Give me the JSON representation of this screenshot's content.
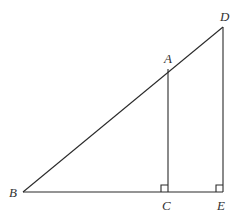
{
  "diagram": {
    "type": "similar right triangles",
    "points": {
      "B": {
        "label": "B",
        "x": 23,
        "y": 192
      },
      "C": {
        "label": "C",
        "x": 168,
        "y": 192
      },
      "E": {
        "label": "E",
        "x": 223,
        "y": 192
      },
      "A": {
        "label": "A",
        "x": 168,
        "y": 69
      },
      "D": {
        "label": "D",
        "x": 223,
        "y": 27
      }
    },
    "segments": [
      "BD",
      "BE",
      "AC",
      "DE"
    ],
    "right_angles": [
      "C",
      "E"
    ],
    "line_color": "#2a2a2a",
    "background": "#ffffff"
  }
}
